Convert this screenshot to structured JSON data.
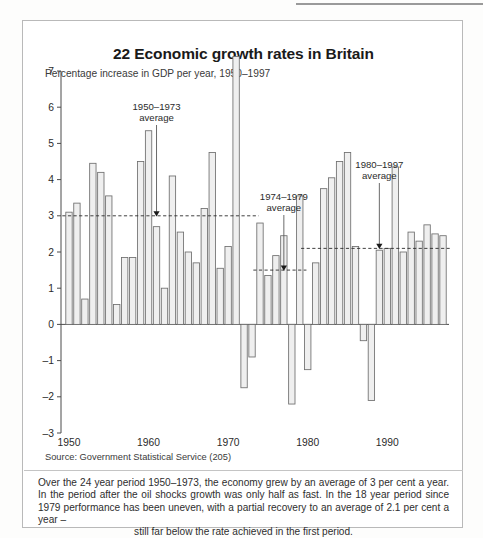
{
  "figure": {
    "title": "22 Economic growth rates in Britain",
    "subtitle": "Percentage increase in GDP per year, 1950–1997",
    "source": "Source: Government Statistical Service (205)",
    "caption_main": "Over the 24 year period 1950–1973, the economy grew by an average of 3 per cent a year. In the period after the oil shocks growth was only half as fast. In the 18 year period since 1979 performance has been uneven, with a partial recovery to an average of 2.1 per cent a year –",
    "caption_last": "still far below the rate achieved in the first period."
  },
  "annotations": [
    {
      "id": "avg-1950-1973",
      "line1": "1950–1973",
      "line2": "average",
      "value": 3.0
    },
    {
      "id": "avg-1974-1979",
      "line1": "1974–1979",
      "line2": "average",
      "value": 1.5
    },
    {
      "id": "avg-1980-1997",
      "line1": "1980–1997",
      "line2": "average",
      "value": 2.1
    }
  ],
  "chart_data": {
    "type": "bar",
    "title": "22 Economic growth rates in Britain",
    "subtitle": "Percentage increase in GDP per year, 1950–1997",
    "xlabel": "",
    "ylabel": "Percentage increase in GDP per year",
    "ylim": [
      -3,
      7
    ],
    "yticks": [
      -3,
      -2,
      -1,
      0,
      1,
      2,
      3,
      4,
      5,
      6,
      7
    ],
    "xticks": [
      1950,
      1960,
      1970,
      1980,
      1990
    ],
    "grid": false,
    "legend": "none",
    "bar_color": "#efefef",
    "bar_edge_color": "#6e6e6e",
    "categories": [
      1950,
      1951,
      1952,
      1953,
      1954,
      1955,
      1956,
      1957,
      1958,
      1959,
      1960,
      1961,
      1962,
      1963,
      1964,
      1965,
      1966,
      1967,
      1968,
      1969,
      1970,
      1971,
      1972,
      1973,
      1974,
      1975,
      1976,
      1977,
      1978,
      1979,
      1980,
      1981,
      1982,
      1983,
      1984,
      1985,
      1986,
      1987,
      1988,
      1989,
      1990,
      1991,
      1992,
      1993,
      1994,
      1995,
      1996,
      1997
    ],
    "values": [
      3.1,
      3.35,
      0.7,
      4.45,
      4.2,
      3.55,
      0.55,
      1.85,
      1.85,
      4.5,
      5.35,
      2.7,
      1.0,
      4.1,
      2.55,
      2.0,
      1.7,
      3.2,
      4.75,
      1.55,
      2.15,
      7.4,
      -1.75,
      -0.9,
      2.8,
      1.35,
      1.9,
      2.45,
      -2.2,
      3.55,
      -1.25,
      1.7,
      3.75,
      4.05,
      4.5,
      4.75,
      2.15,
      -0.45,
      -2.1,
      2.05,
      2.1,
      4.35,
      2.0,
      2.55,
      2.3,
      2.75,
      2.5,
      2.45
    ],
    "reference_lines": [
      {
        "label": "1950–1973 average",
        "value": 3.0,
        "x_start": 1950,
        "x_end": 1973,
        "style": "dashed"
      },
      {
        "label": "1974–1979 average",
        "value": 1.5,
        "x_start": 1974,
        "x_end": 1979,
        "style": "dashed"
      },
      {
        "label": "1980–1997 average",
        "value": 2.1,
        "x_start": 1980,
        "x_end": 1997,
        "style": "dashed"
      }
    ]
  }
}
